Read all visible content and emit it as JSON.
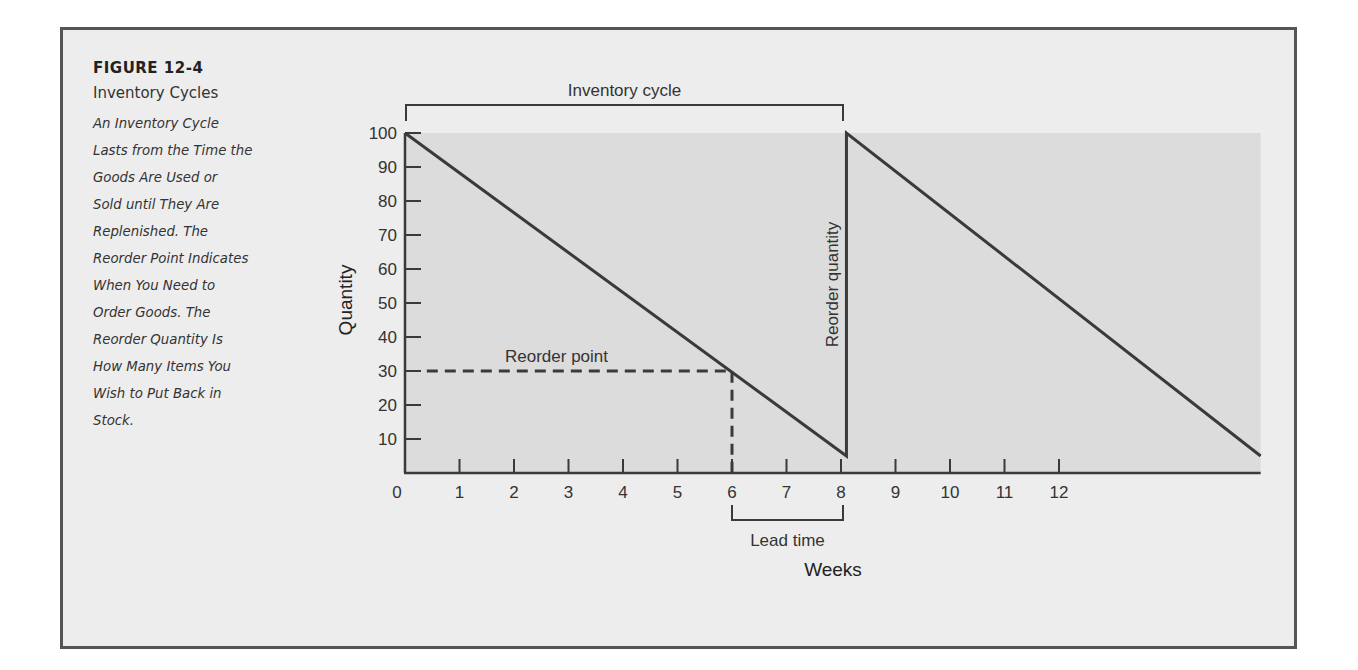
{
  "figure": {
    "number": "FIGURE 12-4",
    "title": "Inventory Cycles",
    "caption_lines": [
      "An Inventory Cycle",
      "Lasts from the Time the",
      "Goods Are Used or",
      "Sold until They Are",
      "Replenished. The",
      "Reorder Point Indicates",
      "When You Need to",
      "Order Goods. The",
      "Reorder Quantity Is",
      "How Many Items You",
      "Wish to Put Back in",
      "Stock."
    ]
  },
  "colors": {
    "frame_bg": "#ededed",
    "frame_border": "#555555",
    "plot_bg": "#dcdcdc",
    "line": "#3a3a3a"
  },
  "chart_data": {
    "type": "line",
    "title": "Inventory Cycles",
    "xlabel": "Weeks",
    "ylabel": "Quantity",
    "x_ticks": [
      0,
      1,
      2,
      3,
      4,
      5,
      6,
      7,
      8,
      9,
      10,
      11,
      12
    ],
    "y_ticks": [
      10,
      20,
      30,
      40,
      50,
      60,
      70,
      80,
      90,
      100
    ],
    "xlim": [
      0,
      15.7
    ],
    "ylim": [
      0,
      100
    ],
    "grid": false,
    "series": [
      {
        "name": "Inventory level",
        "x": [
          0,
          8.1,
          8.1,
          15.7
        ],
        "y": [
          100,
          5,
          100,
          5
        ]
      },
      {
        "name": "Reorder point (dashed)",
        "x": [
          0.4,
          6,
          6
        ],
        "y": [
          30,
          30,
          0
        ]
      }
    ],
    "annotations": [
      {
        "text": "Inventory cycle",
        "type": "bracket",
        "x_range": [
          0,
          8
        ],
        "position": "above plot"
      },
      {
        "text": "Reorder point",
        "x": 3.5,
        "y": 33
      },
      {
        "text": "Reorder quantity",
        "type": "vertical label",
        "x": 8,
        "y_range": [
          5,
          100
        ]
      },
      {
        "text": "Lead time",
        "type": "bracket",
        "x_range": [
          6,
          8
        ],
        "position": "below axis"
      }
    ]
  }
}
